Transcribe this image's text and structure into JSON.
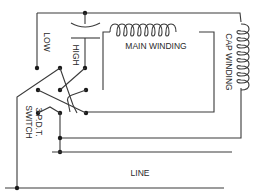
{
  "diagram": {
    "type": "wiring-diagram",
    "colors": {
      "line": "#3a3a3a",
      "dot": "#1a1a1a",
      "background": "#ffffff"
    },
    "labels": {
      "low": "LOW",
      "high": "HIGH",
      "main_winding": "MAIN WINDING",
      "cap_winding": "CAP WINDING",
      "switch_line1": "3 P.D.T.",
      "switch_line2": "SWITCH",
      "line": "LINE"
    },
    "components": [
      {
        "id": "capacitor",
        "name": "Capacitor"
      },
      {
        "id": "main-winding",
        "name": "Main Winding"
      },
      {
        "id": "cap-winding",
        "name": "Cap Winding"
      },
      {
        "id": "switch",
        "name": "3 P.D.T. Switch"
      },
      {
        "id": "line",
        "name": "Line"
      }
    ]
  }
}
